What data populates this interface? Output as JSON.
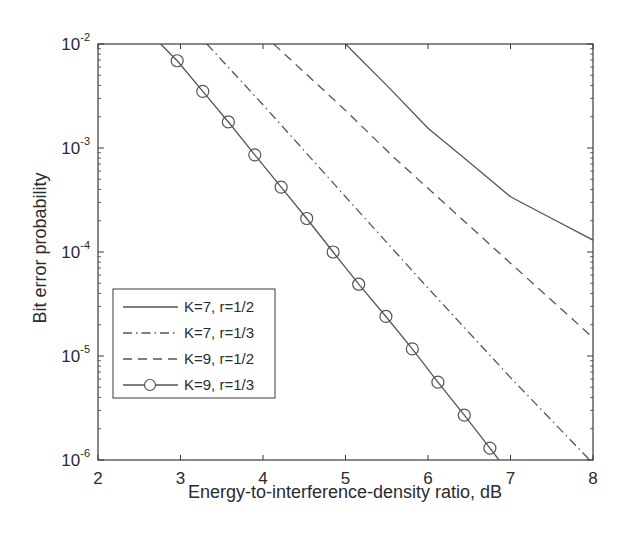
{
  "chart_data": {
    "type": "line",
    "title": "",
    "xlabel": "Energy-to-interference-density ratio, dB",
    "ylabel": "Bit error probability",
    "xlim": [
      2,
      8
    ],
    "ylim": [
      1e-06,
      0.01
    ],
    "yscale": "log",
    "grid": false,
    "legend_position": "lower-left",
    "x_ticks": [
      2,
      3,
      4,
      5,
      6,
      7,
      8
    ],
    "x_tick_labels": [
      "2",
      "3",
      "4",
      "5",
      "6",
      "7",
      "8"
    ],
    "y_ticks": [
      1e-06,
      1e-05,
      0.0001,
      0.001,
      0.01
    ],
    "y_tick_labels": [
      {
        "base": "10",
        "exp": "-6"
      },
      {
        "base": "10",
        "exp": "-5"
      },
      {
        "base": "10",
        "exp": "-4"
      },
      {
        "base": "10",
        "exp": "-3"
      },
      {
        "base": "10",
        "exp": "-2"
      }
    ],
    "series": [
      {
        "name": "K=7, r=1/2",
        "style": "solid",
        "marker": "none",
        "x": [
          5.0,
          5.5,
          6.0,
          6.5,
          7.0,
          7.5,
          8.0
        ],
        "y": [
          0.01,
          0.004,
          0.00155,
          0.00073,
          0.00034,
          0.00021,
          0.00013
        ]
      },
      {
        "name": "K=7, r=1/3",
        "style": "dashdot",
        "marker": "none",
        "x": [
          3.32,
          4.0,
          5.0,
          5.58,
          6.0,
          7.0,
          7.96
        ],
        "y": [
          0.01,
          0.0026,
          0.00034,
          0.000105,
          4.5e-05,
          6.2e-06,
          1e-06
        ]
      },
      {
        "name": "K=9, r=1/2",
        "style": "dashed",
        "marker": "none",
        "x": [
          4.13,
          5.0,
          5.58,
          6.0,
          7.0,
          8.0
        ],
        "y": [
          0.01,
          0.0023,
          0.00082,
          0.00041,
          7.8e-05,
          1.5e-05
        ]
      },
      {
        "name": "K=9, r=1/3",
        "style": "solid",
        "marker": "circle",
        "x": [
          2.76,
          2.96,
          3.27,
          3.58,
          3.9,
          4.22,
          4.53,
          4.85,
          5.16,
          5.49,
          5.81,
          6.12,
          6.44,
          6.75,
          6.86
        ],
        "y": [
          0.01,
          0.0069,
          0.0035,
          0.00178,
          0.00086,
          0.00042,
          0.00021,
          0.0001,
          4.9e-05,
          2.4e-05,
          1.17e-05,
          5.6e-06,
          2.7e-06,
          1.3e-06,
          1e-06
        ],
        "marker_indices": [
          1,
          2,
          3,
          4,
          5,
          6,
          7,
          8,
          9,
          10,
          11,
          12,
          13
        ]
      }
    ]
  },
  "colors": {
    "axis": "#3a3a3a",
    "line": "#555555",
    "text": "#2b2b2b",
    "background": "#ffffff"
  }
}
